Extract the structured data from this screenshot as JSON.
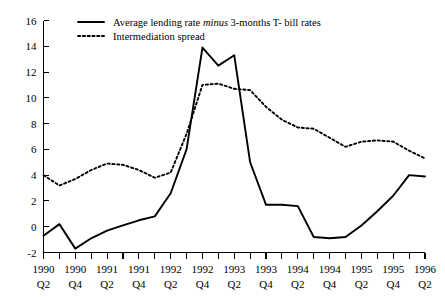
{
  "chart_data": {
    "type": "line",
    "title": "",
    "xlabel": "",
    "ylabel": "",
    "ylim": [
      -2,
      16
    ],
    "ytick_values": [
      -2,
      0,
      2,
      4,
      6,
      8,
      10,
      12,
      14,
      16
    ],
    "ytick_labels": [
      "-2",
      "0",
      "2",
      "4",
      "6",
      "8",
      "10",
      "12",
      "14",
      "16"
    ],
    "grid": false,
    "legend_position": "top-left",
    "categories": [
      "1990 Q2",
      "1990 Q3",
      "1990 Q4",
      "1991 Q1",
      "1991 Q2",
      "1991 Q3",
      "1991 Q4",
      "1992 Q1",
      "1992 Q2",
      "1992 Q3",
      "1992 Q4",
      "1993 Q1",
      "1993 Q2",
      "1993 Q3",
      "1993 Q4",
      "1994 Q1",
      "1994 Q2",
      "1994 Q3",
      "1994 Q4",
      "1995 Q1",
      "1995 Q2",
      "1995 Q3",
      "1995 Q4",
      "1996 Q1",
      "1996 Q2"
    ],
    "xtick_labels": [
      {
        "year": "1990",
        "quarter": "Q2"
      },
      {
        "year": "1990",
        "quarter": "Q4"
      },
      {
        "year": "1991",
        "quarter": "Q2"
      },
      {
        "year": "1991",
        "quarter": "Q4"
      },
      {
        "year": "1992",
        "quarter": "Q2"
      },
      {
        "year": "1992",
        "quarter": "Q4"
      },
      {
        "year": "1993",
        "quarter": "Q2"
      },
      {
        "year": "1993",
        "quarter": "Q4"
      },
      {
        "year": "1994",
        "quarter": "Q2"
      },
      {
        "year": "1994",
        "quarter": "Q4"
      },
      {
        "year": "1995",
        "quarter": "Q2"
      },
      {
        "year": "1995",
        "quarter": "Q4"
      },
      {
        "year": "1996",
        "quarter": "Q2"
      }
    ],
    "series": [
      {
        "name": "Average lending rate minus 3-months T- bill rates",
        "style": "solid",
        "color": "#000000",
        "values": [
          -0.7,
          0.2,
          -1.7,
          -0.9,
          -0.3,
          0.1,
          0.5,
          0.8,
          2.6,
          6.0,
          13.9,
          12.5,
          13.3,
          5.0,
          1.7,
          1.7,
          1.6,
          -0.8,
          -0.9,
          -0.8,
          0.1,
          1.2,
          2.4,
          4.0,
          3.9
        ]
      },
      {
        "name": "Intermediation spread",
        "style": "dashed",
        "color": "#000000",
        "values": [
          4.0,
          3.2,
          3.7,
          4.4,
          4.9,
          4.8,
          4.4,
          3.8,
          4.2,
          7.2,
          11.0,
          11.1,
          10.7,
          10.6,
          9.3,
          8.3,
          7.7,
          7.6,
          6.9,
          6.2,
          6.6,
          6.7,
          6.6,
          5.9,
          5.3
        ]
      }
    ]
  },
  "legend": {
    "items": [
      {
        "style": "solid",
        "text_before": "Average lending rate ",
        "text_emphasis": "minus",
        "text_after": " 3-months T- bill rates"
      },
      {
        "style": "dashed",
        "text_before": "Intermediation spread",
        "text_emphasis": "",
        "text_after": ""
      }
    ]
  }
}
